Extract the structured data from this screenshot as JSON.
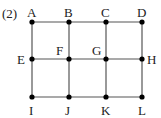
{
  "problem_label": "(2)",
  "colors": {
    "line": "#555555",
    "dot": "#000000",
    "text": "#222222"
  },
  "points": {
    "A": {
      "label": "A",
      "x": 32,
      "y": 22
    },
    "B": {
      "label": "B",
      "x": 69,
      "y": 22
    },
    "C": {
      "label": "C",
      "x": 106,
      "y": 22
    },
    "D": {
      "label": "D",
      "x": 142,
      "y": 22
    },
    "E": {
      "label": "E",
      "x": 32,
      "y": 59
    },
    "F": {
      "label": "F",
      "x": 69,
      "y": 59
    },
    "G": {
      "label": "G",
      "x": 106,
      "y": 59
    },
    "H": {
      "label": "H",
      "x": 142,
      "y": 59
    },
    "I": {
      "label": "I",
      "x": 32,
      "y": 97
    },
    "J": {
      "label": "J",
      "x": 69,
      "y": 97
    },
    "K": {
      "label": "K",
      "x": 106,
      "y": 97
    },
    "L": {
      "label": "L",
      "x": 142,
      "y": 97
    }
  },
  "edges": [
    [
      "A",
      "B"
    ],
    [
      "B",
      "C"
    ],
    [
      "C",
      "D"
    ],
    [
      "E",
      "F"
    ],
    [
      "F",
      "G"
    ],
    [
      "G",
      "H"
    ],
    [
      "I",
      "J"
    ],
    [
      "J",
      "K"
    ],
    [
      "K",
      "L"
    ],
    [
      "A",
      "E"
    ],
    [
      "E",
      "I"
    ],
    [
      "B",
      "F"
    ],
    [
      "F",
      "J"
    ],
    [
      "C",
      "G"
    ],
    [
      "G",
      "K"
    ],
    [
      "D",
      "H"
    ],
    [
      "H",
      "L"
    ]
  ]
}
